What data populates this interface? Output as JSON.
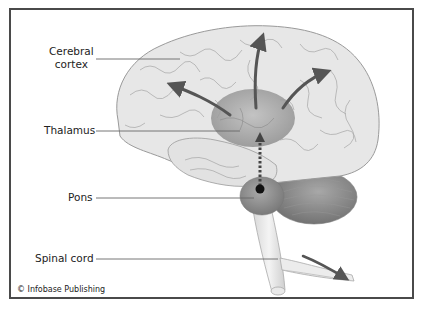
{
  "diagram": {
    "labels": [
      {
        "id": "cerebral-cortex",
        "line1": "Cerebral",
        "line2": "cortex"
      },
      {
        "id": "thalamus",
        "text": "Thalamus"
      },
      {
        "id": "pons",
        "text": "Pons"
      },
      {
        "id": "spinal-cord",
        "text": "Spinal cord"
      }
    ],
    "credit": "© Infobase Publishing",
    "colors": {
      "frame": "#4a4a4a",
      "cortex_fill": "#e6e6e6",
      "cortex_stroke": "#a0a0a0",
      "thalamus_fill": "#9a9a9a",
      "cerebellum_fill": "#8a8a8a",
      "arrow": "#555555",
      "leader_line": "#555555"
    }
  }
}
